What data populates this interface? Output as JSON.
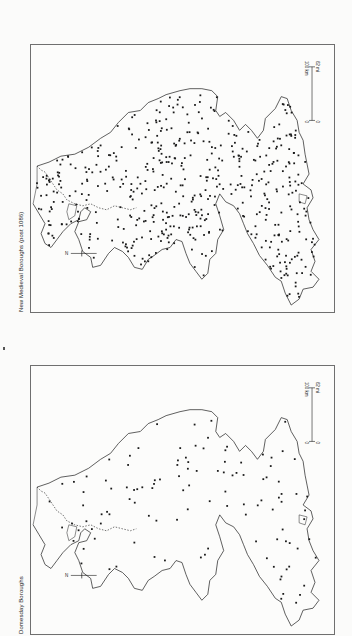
{
  "page": {
    "page_marker": "."
  },
  "maps": [
    {
      "id": "top",
      "title": "New Medieval Boroughs (post 1086)",
      "north_label": "N",
      "scale": {
        "km_label": "100 km",
        "mi_label": "62 mi",
        "zero": "0"
      },
      "dot_count": 520,
      "dot_seed": 7
    },
    {
      "id": "bottom",
      "title": "Domesday Boroughs",
      "north_label": "N",
      "scale": {
        "km_label": "100 km",
        "mi_label": "62 mi",
        "zero": "0"
      },
      "dot_count": 115,
      "dot_seed": 3
    }
  ],
  "colors": {
    "ink": "#1a1a1a",
    "frame": "#6f6f6f",
    "paper": "#fbfbfa"
  }
}
